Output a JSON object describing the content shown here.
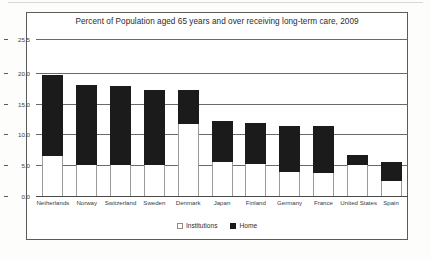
{
  "chart_data": {
    "type": "bar",
    "stacked": true,
    "title": "Percent of Population aged 65 years and over receiving long-term care, 2009",
    "xlabel": "",
    "ylabel": "",
    "ylim": [
      0.0,
      25.5
    ],
    "yticks": [
      "0.0",
      "5.0",
      "10.0",
      "15.0",
      "20.0",
      "25.5"
    ],
    "ytick_values": [
      0.0,
      5.0,
      10.0,
      15.0,
      20.0,
      25.5
    ],
    "grid": true,
    "legend_position": "bottom-center",
    "categories": [
      "Netherlands",
      "Norway",
      "Switzerland",
      "Sweden",
      "Denmark",
      "Japan",
      "Finland",
      "Germany",
      "France",
      "United States",
      "Spain"
    ],
    "series": [
      {
        "name": "Institutions",
        "color": "#ffffff",
        "values": [
          6.5,
          5.0,
          5.0,
          5.0,
          11.7,
          5.5,
          5.2,
          3.9,
          3.8,
          5.0,
          2.5
        ]
      },
      {
        "name": "Home",
        "color": "#1b1b1b",
        "values": [
          13.1,
          13.1,
          12.9,
          12.3,
          5.6,
          6.7,
          6.7,
          7.4,
          7.5,
          1.6,
          3.0
        ]
      }
    ],
    "totals": [
      19.6,
      18.1,
      17.9,
      17.3,
      17.3,
      12.2,
      11.9,
      11.3,
      11.3,
      6.6,
      5.5
    ]
  },
  "legend": {
    "items": [
      {
        "label": "Institutions",
        "swatch": "white-square"
      },
      {
        "label": "Home",
        "swatch": "black-square"
      }
    ]
  },
  "colors": {
    "home": "#1b1b1b",
    "institutions": "#ffffff",
    "gridline": "#6a6a6a",
    "frame": "#5b5b5b",
    "text": "#2b2b2b"
  }
}
